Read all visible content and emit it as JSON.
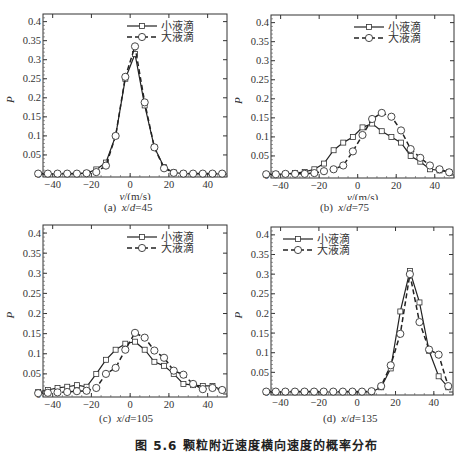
{
  "figure": {
    "caption": "图 5.6  颗粒附近速度横向速度的概率分布",
    "y_label": "P",
    "x_label": "v/(m/s)"
  },
  "legend": {
    "small": "小液滴",
    "large": "大液滴"
  },
  "chart_data": [
    {
      "id": "a",
      "type": "line",
      "title": "(a) x/d=45",
      "xlabel": "v/(m/s)",
      "ylabel": "P",
      "xlim": [
        -45,
        50
      ],
      "ylim": [
        0,
        0.42
      ],
      "xticks": [
        -40,
        -20,
        0,
        20,
        40
      ],
      "yticks": [
        0,
        0.05,
        0.1,
        0.15,
        0.2,
        0.25,
        0.3,
        0.35,
        0.4
      ],
      "legend_position": "upper right",
      "series": [
        {
          "name": "小液滴",
          "marker": "square",
          "style": "solid",
          "x": [
            -47.5,
            -42.5,
            -37.5,
            -32.5,
            -27.5,
            -22.5,
            -17.5,
            -12.5,
            -7.5,
            -2.5,
            2.5,
            7.5,
            12.5,
            17.5,
            22.5,
            27.5,
            32.5,
            37.5,
            42.5,
            47.5
          ],
          "y": [
            0,
            0,
            0,
            0,
            0,
            0.002,
            0.012,
            0.03,
            0.1,
            0.25,
            0.315,
            0.18,
            0.07,
            0.018,
            0.004,
            0.001,
            0,
            0,
            0,
            0
          ]
        },
        {
          "name": "大液滴",
          "marker": "circle",
          "style": "dashed",
          "x": [
            -47.5,
            -42.5,
            -37.5,
            -32.5,
            -27.5,
            -22.5,
            -17.5,
            -12.5,
            -7.5,
            -2.5,
            2.5,
            7.5,
            12.5,
            17.5,
            22.5,
            27.5,
            32.5,
            37.5,
            42.5,
            47.5
          ],
          "y": [
            0.001,
            0.001,
            0.001,
            0.001,
            0.001,
            0.002,
            0.005,
            0.022,
            0.1,
            0.255,
            0.335,
            0.188,
            0.07,
            0.015,
            0.003,
            0.001,
            0.001,
            0.001,
            0.001,
            0.001
          ]
        }
      ]
    },
    {
      "id": "b",
      "type": "line",
      "title": "(b) x/d=75",
      "xlabel": "v/(m/s)",
      "ylabel": "P",
      "xlim": [
        -45,
        50
      ],
      "ylim": [
        0,
        0.42
      ],
      "xticks": [
        -40,
        -20,
        0,
        20,
        40
      ],
      "yticks": [
        0,
        0.05,
        0.1,
        0.15,
        0.2,
        0.25,
        0.3,
        0.35,
        0.4
      ],
      "legend_position": "upper right",
      "series": [
        {
          "name": "小液滴",
          "marker": "square",
          "style": "solid",
          "x": [
            -47.5,
            -42.5,
            -37.5,
            -32.5,
            -27.5,
            -22.5,
            -17.5,
            -12.5,
            -7.5,
            -2.5,
            2.5,
            7.5,
            12.5,
            17.5,
            22.5,
            27.5,
            32.5,
            37.5,
            42.5,
            47.5
          ],
          "y": [
            0.001,
            0.002,
            0.003,
            0.005,
            0.008,
            0.015,
            0.03,
            0.065,
            0.085,
            0.1,
            0.125,
            0.135,
            0.115,
            0.1,
            0.085,
            0.05,
            0.035,
            0.015,
            0.012,
            0.008
          ]
        },
        {
          "name": "大液滴",
          "marker": "circle",
          "style": "dashed",
          "x": [
            -47.5,
            -42.5,
            -37.5,
            -32.5,
            -27.5,
            -22.5,
            -17.5,
            -12.5,
            -7.5,
            -2.5,
            2.5,
            7.5,
            12.5,
            17.5,
            22.5,
            27.5,
            32.5,
            37.5,
            42.5,
            47.5
          ],
          "y": [
            0.002,
            0.002,
            0.003,
            0.003,
            0.003,
            0.005,
            0.01,
            0.015,
            0.025,
            0.062,
            0.105,
            0.147,
            0.163,
            0.153,
            0.117,
            0.068,
            0.045,
            0.025,
            0.015,
            0.007
          ]
        }
      ]
    },
    {
      "id": "c",
      "type": "line",
      "title": "(c) x/d=105",
      "xlabel": "v/(m/s)",
      "ylabel": "P",
      "xlim": [
        -45,
        50
      ],
      "ylim": [
        0,
        0.42
      ],
      "xticks": [
        -40,
        -20,
        0,
        20,
        40
      ],
      "yticks": [
        0,
        0.05,
        0.1,
        0.15,
        0.2,
        0.25,
        0.3,
        0.35,
        0.4
      ],
      "legend_position": "upper right",
      "series": [
        {
          "name": "小液滴",
          "marker": "square",
          "style": "solid",
          "x": [
            -47.5,
            -42.5,
            -37.5,
            -32.5,
            -27.5,
            -22.5,
            -17.5,
            -12.5,
            -7.5,
            -2.5,
            2.5,
            7.5,
            12.5,
            17.5,
            22.5,
            27.5,
            32.5,
            37.5,
            42.5,
            47.5
          ],
          "y": [
            0.005,
            0.01,
            0.015,
            0.018,
            0.022,
            0.018,
            0.05,
            0.085,
            0.11,
            0.125,
            0.13,
            0.11,
            0.08,
            0.07,
            0.05,
            0.025,
            0.022,
            0.02,
            0.02,
            0.01
          ]
        },
        {
          "name": "大液滴",
          "marker": "circle",
          "style": "dashed",
          "x": [
            -47.5,
            -42.5,
            -37.5,
            -32.5,
            -27.5,
            -22.5,
            -17.5,
            -12.5,
            -7.5,
            -2.5,
            2.5,
            7.5,
            12.5,
            17.5,
            22.5,
            27.5,
            32.5,
            37.5,
            42.5,
            47.5
          ],
          "y": [
            0.002,
            0.003,
            0.004,
            0.005,
            0.007,
            0.008,
            0.015,
            0.05,
            0.065,
            0.11,
            0.152,
            0.14,
            0.108,
            0.09,
            0.058,
            0.048,
            0.025,
            0.012,
            0.015,
            0.01
          ]
        }
      ]
    },
    {
      "id": "d",
      "type": "line",
      "title": "(d) x/d=135",
      "xlabel": "v/(m/s)",
      "ylabel": "P",
      "xlim": [
        -45,
        50
      ],
      "ylim": [
        0,
        0.42
      ],
      "xticks": [
        -40,
        -20,
        0,
        20,
        40
      ],
      "yticks": [
        0,
        0.05,
        0.1,
        0.15,
        0.2,
        0.25,
        0.3,
        0.35,
        0.4
      ],
      "legend_position": "upper left",
      "series": [
        {
          "name": "小液滴",
          "marker": "square",
          "style": "solid",
          "x": [
            -47.5,
            -42.5,
            -37.5,
            -32.5,
            -27.5,
            -22.5,
            -17.5,
            -12.5,
            -7.5,
            -2.5,
            2.5,
            7.5,
            12.5,
            17.5,
            22.5,
            27.5,
            32.5,
            37.5,
            42.5,
            47.5
          ],
          "y": [
            0,
            0,
            0,
            0,
            0,
            0,
            0,
            0,
            0,
            0,
            0,
            0,
            0.012,
            0.06,
            0.205,
            0.308,
            0.228,
            0.105,
            0.04,
            0.012
          ]
        },
        {
          "name": "大液滴",
          "marker": "circle",
          "style": "dashed",
          "x": [
            -47.5,
            -42.5,
            -37.5,
            -32.5,
            -27.5,
            -22.5,
            -17.5,
            -12.5,
            -7.5,
            -2.5,
            2.5,
            7.5,
            12.5,
            17.5,
            22.5,
            27.5,
            32.5,
            37.5,
            42.5,
            47.5
          ],
          "y": [
            0.001,
            0.001,
            0.001,
            0.001,
            0.001,
            0.001,
            0.001,
            0.001,
            0.001,
            0.001,
            0.001,
            0.002,
            0.015,
            0.068,
            0.148,
            0.3,
            0.178,
            0.108,
            0.095,
            0.015
          ]
        }
      ]
    }
  ],
  "panels": [
    {
      "label": "(a)",
      "xd": "45"
    },
    {
      "label": "(b)",
      "xd": "75"
    },
    {
      "label": "(c)",
      "xd": "105"
    },
    {
      "label": "(d)",
      "xd": "135"
    }
  ]
}
